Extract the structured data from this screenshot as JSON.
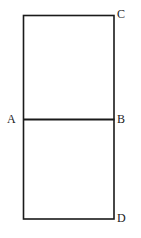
{
  "figure": {
    "kind": "geometry-diagram",
    "canvas": {
      "width": 141,
      "height": 238,
      "background": "#ffffff"
    },
    "style": {
      "stroke_color": "#1a1a1a",
      "outline_width": 1.6,
      "divider_width": 2.0,
      "label_font_size": 12,
      "label_color": "#1a1a1a"
    },
    "shapes": {
      "rectangle": {
        "name": "outer-rectangle",
        "left": 23.5,
        "top": 15.5,
        "right": 114.0,
        "bottom": 219.0,
        "width": 90.5,
        "height": 203.5
      },
      "divider": {
        "name": "segment-AB",
        "x1": 23.5,
        "y1": 119.5,
        "x2": 114.0,
        "y2": 119.5
      }
    },
    "labels": [
      {
        "id": "C",
        "text": "C",
        "position": "top-right",
        "x": 117,
        "y": 8
      },
      {
        "id": "B",
        "text": "B",
        "position": "right-middle",
        "x": 117,
        "y": 113
      },
      {
        "id": "A",
        "text": "A",
        "position": "left-middle",
        "x": 7,
        "y": 113
      },
      {
        "id": "D",
        "text": "D",
        "position": "bottom-right",
        "x": 117,
        "y": 212
      }
    ]
  }
}
